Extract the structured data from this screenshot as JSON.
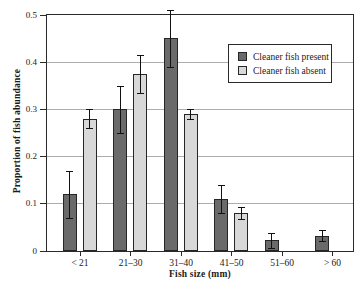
{
  "figure": {
    "ylabel": "Proportion of fish abundance",
    "xlabel": "Fish size (mm)"
  },
  "legend": {
    "items": [
      {
        "label": "Cleaner fish present",
        "color": "#6a6a6a"
      },
      {
        "label": "Cleaner fish absent",
        "color": "#d8d8d8"
      }
    ]
  },
  "chart_data": {
    "type": "bar",
    "categories": [
      "< 21",
      "21–30",
      "31–40",
      "41–50",
      "51–60",
      "> 60"
    ],
    "series": [
      {
        "name": "Cleaner fish present",
        "color": "#6a6a6a",
        "values": [
          0.12,
          0.3,
          0.45,
          0.11,
          0.022,
          0.032
        ],
        "errors": [
          0.05,
          0.05,
          0.06,
          0.03,
          0.015,
          0.012
        ]
      },
      {
        "name": "Cleaner fish absent",
        "color": "#d8d8d8",
        "values": [
          0.28,
          0.375,
          0.29,
          0.08,
          0,
          0
        ],
        "errors": [
          0.02,
          0.04,
          0.01,
          0.012,
          0,
          0
        ]
      }
    ],
    "title": "",
    "xlabel": "Fish size (mm)",
    "ylabel": "Proportion of fish abundance",
    "ylim": [
      0,
      0.5
    ],
    "yticks": [
      0,
      0.1,
      0.2,
      0.3,
      0.4,
      0.5
    ],
    "grid": true,
    "legend_position": "upper right",
    "error_bars": true
  }
}
